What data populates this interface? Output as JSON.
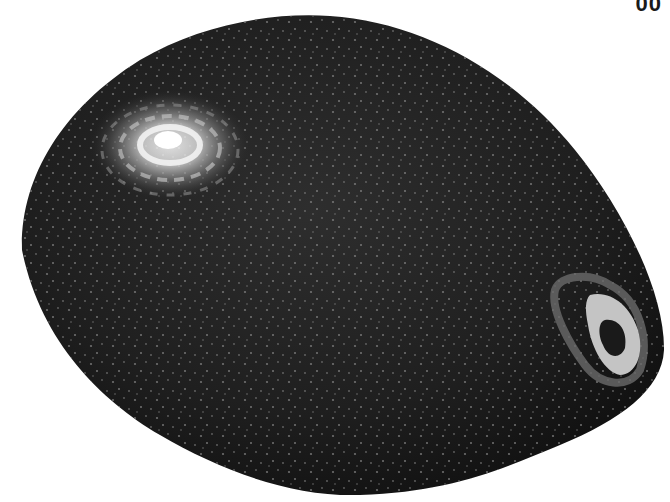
{
  "image": {
    "subject": "dark textured avocado-like fruit",
    "background_color": "#ffffff",
    "body_color": "#1c1c1c",
    "speckle_color": "#8a8a8a",
    "highlight_color": "#f2f2f2"
  },
  "corner_label": "00"
}
